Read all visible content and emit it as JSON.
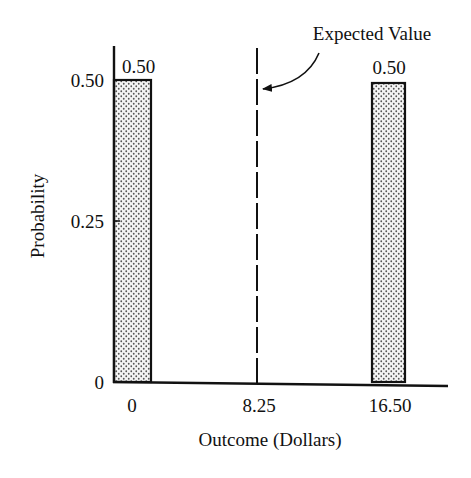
{
  "chart_data": {
    "type": "bar",
    "title": "",
    "xlabel": "Outcome (Dollars)",
    "ylabel": "Probability",
    "categories": [
      "0",
      "16.50"
    ],
    "x": [
      0,
      16.5
    ],
    "values": [
      0.5,
      0.5
    ],
    "data_labels": [
      "0.50",
      "0.50"
    ],
    "xlim": [
      0,
      16.5
    ],
    "ylim": [
      0,
      0.5
    ],
    "x_ticks": [
      {
        "value": 0,
        "label": "0"
      },
      {
        "value": 8.25,
        "label": "8.25"
      },
      {
        "value": 16.5,
        "label": "16.50"
      }
    ],
    "y_ticks": [
      {
        "value": 0,
        "label": "0"
      },
      {
        "value": 0.25,
        "label": "0.25"
      },
      {
        "value": 0.5,
        "label": "0.50"
      }
    ],
    "bar_fill": "stippled",
    "grid": false,
    "legend": "none",
    "reference_line": {
      "x": 8.25,
      "style": "dashed",
      "label": "Expected Value"
    },
    "annotations": [
      {
        "text": "Expected Value",
        "points_to": "reference_line",
        "arrow": true
      }
    ]
  },
  "colors": {
    "ink": "#111111",
    "background": "#ffffff",
    "stipple": "#555555"
  }
}
